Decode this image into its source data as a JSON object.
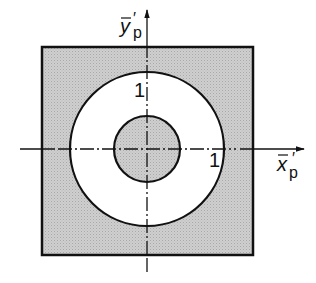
{
  "diagram": {
    "axes": {
      "x_label": "x",
      "x_sub": "p",
      "x_prime": "′",
      "y_label": "y",
      "y_sub": "p",
      "y_prime": "′"
    },
    "ring_labels": {
      "top": "1",
      "right": "1"
    },
    "colors": {
      "shaded": "#c8c8c8",
      "stroke": "#111111",
      "white": "#ffffff"
    }
  }
}
